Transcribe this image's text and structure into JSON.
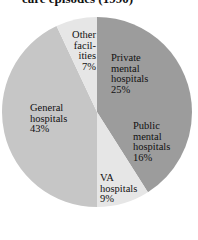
{
  "chart_data": {
    "type": "pie",
    "title": "care episodes (1990)",
    "categories": [
      "Private mental hospitals",
      "Public mental hospitals",
      "VA hospitals",
      "General hospitals",
      "Other facilities"
    ],
    "values": [
      25,
      16,
      9,
      43,
      7
    ],
    "unit": "%",
    "start_angle_deg": 0,
    "direction": "clockwise",
    "colors": [
      "#9c9c9c",
      "#9c9c9c",
      "#e6e6e6",
      "#c6c6c6",
      "#e6e6e6"
    ],
    "labels": [
      {
        "lines": [
          "Private",
          "mental",
          "hospitals",
          "25%"
        ]
      },
      {
        "lines": [
          "Public",
          "mental",
          "hospitals",
          "16%"
        ]
      },
      {
        "lines": [
          "VA",
          "hospitals",
          "9%"
        ]
      },
      {
        "lines": [
          "General",
          "hospitals",
          "43%"
        ]
      },
      {
        "lines": [
          "Other",
          "facil-",
          "ities",
          "7%"
        ]
      }
    ]
  },
  "geometry": {
    "cx": 97,
    "cy": 112,
    "r": 95
  }
}
